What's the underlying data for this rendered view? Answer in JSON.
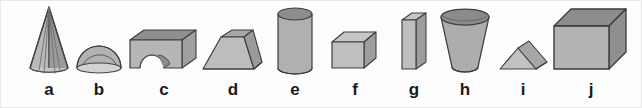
{
  "figure": {
    "background_color": "#fdfdfd",
    "border_color": "#e8e8e8",
    "label_color": "#1a1a1a",
    "outline_color": "#4a4a4a",
    "fill_light": "#cccccc",
    "fill_mid": "#b4b4b4",
    "fill_dark": "#909090",
    "fill_darker": "#7e7e7e",
    "width": 642,
    "height": 108
  },
  "shapes": [
    {
      "label": "a",
      "name": "cone",
      "icon": "cone-solid-icon",
      "x": 10,
      "y": 4,
      "w": 78,
      "h": 74,
      "label_y": 80
    },
    {
      "label": "b",
      "name": "hemisphere",
      "icon": "hemisphere-solid-icon",
      "x": 68,
      "y": 4,
      "w": 62,
      "h": 74,
      "label_y": 80
    },
    {
      "label": "c",
      "name": "arch-block",
      "icon": "arch-block-solid-icon",
      "x": 124,
      "y": 4,
      "w": 80,
      "h": 74,
      "label_y": 80
    },
    {
      "label": "d",
      "name": "pyramid-frustum",
      "icon": "pyramid-frustum-solid-icon",
      "x": 196,
      "y": 4,
      "w": 74,
      "h": 74,
      "label_y": 80
    },
    {
      "label": "e",
      "name": "cylinder",
      "icon": "cylinder-solid-icon",
      "x": 264,
      "y": 4,
      "w": 62,
      "h": 74,
      "label_y": 80
    },
    {
      "label": "f",
      "name": "cube-small",
      "icon": "cube-solid-icon",
      "x": 322,
      "y": 4,
      "w": 66,
      "h": 74,
      "label_y": 80
    },
    {
      "label": "g",
      "name": "thin-slab-prism",
      "icon": "slab-prism-solid-icon",
      "x": 386,
      "y": 4,
      "w": 56,
      "h": 74,
      "label_y": 80
    },
    {
      "label": "h",
      "name": "cone-frustum-cup",
      "icon": "cone-frustum-solid-icon",
      "x": 432,
      "y": 4,
      "w": 66,
      "h": 74,
      "label_y": 80
    },
    {
      "label": "i",
      "name": "triangular-prism-wedge",
      "icon": "triangular-prism-solid-icon",
      "x": 492,
      "y": 4,
      "w": 62,
      "h": 74,
      "label_y": 80
    },
    {
      "label": "j",
      "name": "cube-large",
      "icon": "cube-large-solid-icon",
      "x": 546,
      "y": 4,
      "w": 90,
      "h": 74,
      "label_y": 80
    }
  ]
}
